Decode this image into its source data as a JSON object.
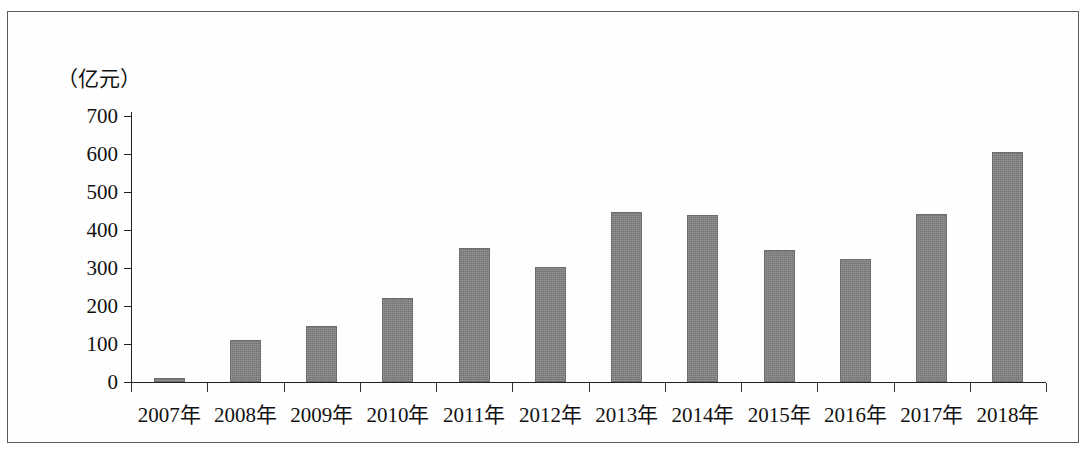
{
  "chart_data": {
    "type": "bar",
    "title": "",
    "subtitle": "",
    "xlabel": "",
    "ylabel": "（亿元）",
    "unit_caption": "（亿元）",
    "categories": [
      "2007年",
      "2008年",
      "2009年",
      "2010年",
      "2011年",
      "2012年",
      "2013年",
      "2014年",
      "2015年",
      "2016年",
      "2017年",
      "2018年"
    ],
    "values": [
      10,
      110,
      148,
      222,
      352,
      303,
      448,
      440,
      348,
      325,
      442,
      605
    ],
    "ylim": [
      0,
      700
    ],
    "ytick_labels": [
      "0",
      "100",
      "200",
      "300",
      "400",
      "500",
      "600",
      "700"
    ],
    "ytick_values": [
      0,
      100,
      200,
      300,
      400,
      500,
      600,
      700
    ],
    "grid": false,
    "legend": null,
    "legend_position": "none",
    "series": [
      {
        "name": "",
        "values": [
          10,
          110,
          148,
          222,
          352,
          303,
          448,
          440,
          348,
          325,
          442,
          605
        ],
        "color": "#7e7e7e"
      }
    ],
    "colors": {
      "bar_fill": "#7e7e7e",
      "bar_border": "#6d6d6d",
      "axis": "#222222",
      "text": "#111111",
      "background": "#ffffff",
      "page_border": "#5a5a5a"
    }
  }
}
